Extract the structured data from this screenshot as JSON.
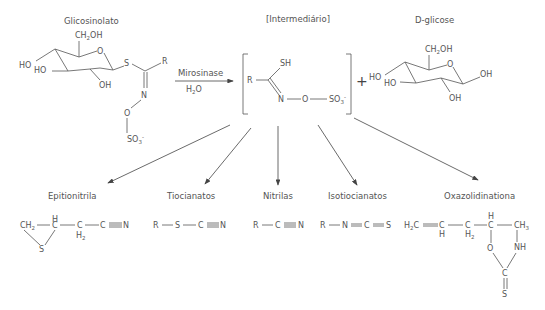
{
  "reactant": {
    "label": "Glicosinolato",
    "groups": [
      "CH2OH",
      "HO",
      "HO",
      "OH",
      "O",
      "S",
      "R",
      "N",
      "O",
      "SO3-"
    ]
  },
  "enzyme": {
    "label": "Mirosinase",
    "cofactor": "H2O"
  },
  "intermediate": {
    "label": "[Intermediário]",
    "groups": [
      "R",
      "SH",
      "N",
      "O",
      "SO3-"
    ]
  },
  "plus": "+",
  "coproduct": {
    "label": "D-glicose",
    "groups": [
      "CH2OH",
      "HO",
      "HO",
      "OH",
      "OH",
      "O"
    ]
  },
  "products": [
    {
      "label": "Epitionitrila",
      "formula": "CH2(S)CH-CH2-C≡N"
    },
    {
      "label": "Tiocianatos",
      "formula": "R-S-C≡N"
    },
    {
      "label": "Nitrilas",
      "formula": "R-C≡N"
    },
    {
      "label": "Isotiocianatos",
      "formula": "R-N=C=S"
    },
    {
      "label": "Oxazolidinationa",
      "formula": "H2C=CH-CH2-CH(O)-CH3 / NH-C(=S)"
    }
  ]
}
